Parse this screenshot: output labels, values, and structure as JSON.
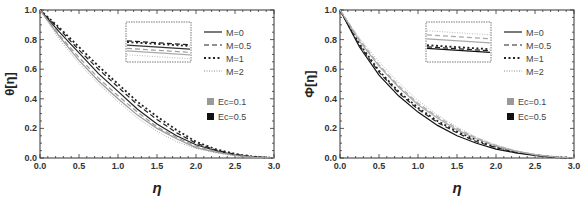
{
  "chart_data": [
    {
      "type": "line",
      "title": "",
      "xlabel": "η",
      "ylabel": "θ[η]",
      "xlim": [
        0,
        3
      ],
      "ylim": [
        0,
        1
      ],
      "xticks": [
        "0.0",
        "0.5",
        "1.0",
        "1.5",
        "2.0",
        "2.5",
        "3.0"
      ],
      "yticks": [
        "0.0",
        "0.2",
        "0.4",
        "0.6",
        "0.8",
        "1.0"
      ],
      "grid": false,
      "legend": {
        "position": "upper right",
        "line_entries": [
          "M=0",
          "M=0.5",
          "M=1",
          "M=2"
        ],
        "color_entries": [
          "Ec=0.1",
          "Ec=0.5"
        ]
      },
      "inset": true,
      "x": [
        0,
        0.25,
        0.5,
        0.75,
        1.0,
        1.25,
        1.5,
        1.75,
        2.0,
        2.25,
        2.5,
        2.75,
        3.0
      ],
      "series": [
        {
          "name": "M=0, Ec=0.5",
          "style": "solid",
          "color": "#222222",
          "values": [
            1.0,
            0.85,
            0.71,
            0.57,
            0.45,
            0.33,
            0.23,
            0.15,
            0.09,
            0.05,
            0.02,
            0.006,
            0.0
          ]
        },
        {
          "name": "M=0.5, Ec=0.5",
          "style": "dashed",
          "color": "#222222",
          "values": [
            1.0,
            0.87,
            0.73,
            0.6,
            0.48,
            0.36,
            0.26,
            0.17,
            0.1,
            0.055,
            0.025,
            0.008,
            0.0
          ]
        },
        {
          "name": "M=1, Ec=0.5",
          "style": "dotted",
          "color": "#222222",
          "values": [
            1.0,
            0.88,
            0.75,
            0.62,
            0.5,
            0.38,
            0.28,
            0.19,
            0.11,
            0.06,
            0.028,
            0.009,
            0.0
          ]
        },
        {
          "name": "M=0, Ec=0.1",
          "style": "solid",
          "color": "#999999",
          "values": [
            1.0,
            0.82,
            0.66,
            0.52,
            0.4,
            0.29,
            0.2,
            0.13,
            0.07,
            0.04,
            0.017,
            0.005,
            0.0
          ]
        },
        {
          "name": "M=0.5, Ec=0.1",
          "style": "dashed",
          "color": "#999999",
          "values": [
            1.0,
            0.83,
            0.68,
            0.54,
            0.42,
            0.31,
            0.21,
            0.14,
            0.08,
            0.045,
            0.019,
            0.006,
            0.0
          ]
        },
        {
          "name": "M=2, Ec=0.1",
          "style": "fine-dotted",
          "color": "#aaaaaa",
          "values": [
            1.0,
            0.8,
            0.64,
            0.5,
            0.38,
            0.27,
            0.18,
            0.11,
            0.065,
            0.035,
            0.015,
            0.004,
            0.0
          ]
        }
      ]
    },
    {
      "type": "line",
      "title": "",
      "xlabel": "η",
      "ylabel": "Φ[η]",
      "xlim": [
        0,
        3
      ],
      "ylim": [
        0,
        1
      ],
      "xticks": [
        "0.0",
        "0.5",
        "1.0",
        "1.5",
        "2.0",
        "2.5",
        "3.0"
      ],
      "yticks": [
        "0.0",
        "0.2",
        "0.4",
        "0.6",
        "0.8",
        "1.0"
      ],
      "grid": false,
      "legend": {
        "position": "upper right",
        "line_entries": [
          "M=0",
          "M=0.5",
          "M=1",
          "M=2"
        ],
        "color_entries": [
          "Ec=0.1",
          "Ec=0.5"
        ]
      },
      "inset": true,
      "x": [
        0,
        0.25,
        0.5,
        0.75,
        1.0,
        1.25,
        1.5,
        1.75,
        2.0,
        2.25,
        2.5,
        2.75,
        3.0
      ],
      "series": [
        {
          "name": "M=0, Ec=0.5",
          "style": "solid",
          "color": "#111111",
          "values": [
            1.0,
            0.75,
            0.56,
            0.42,
            0.31,
            0.22,
            0.15,
            0.1,
            0.06,
            0.035,
            0.017,
            0.005,
            0.0
          ]
        },
        {
          "name": "M=0.5, Ec=0.5",
          "style": "dashed",
          "color": "#222222",
          "values": [
            1.0,
            0.76,
            0.58,
            0.44,
            0.33,
            0.24,
            0.17,
            0.11,
            0.07,
            0.04,
            0.019,
            0.006,
            0.0
          ]
        },
        {
          "name": "M=1, Ec=0.5",
          "style": "dotted",
          "color": "#222222",
          "values": [
            1.0,
            0.77,
            0.59,
            0.45,
            0.34,
            0.25,
            0.18,
            0.12,
            0.075,
            0.043,
            0.02,
            0.006,
            0.0
          ]
        },
        {
          "name": "M=0, Ec=0.1",
          "style": "solid",
          "color": "#aaaaaa",
          "values": [
            1.0,
            0.79,
            0.62,
            0.48,
            0.36,
            0.27,
            0.19,
            0.13,
            0.08,
            0.046,
            0.022,
            0.007,
            0.0
          ]
        },
        {
          "name": "M=0.5, Ec=0.1",
          "style": "dashed",
          "color": "#aaaaaa",
          "values": [
            1.0,
            0.8,
            0.63,
            0.49,
            0.37,
            0.28,
            0.2,
            0.135,
            0.085,
            0.048,
            0.023,
            0.007,
            0.0
          ]
        },
        {
          "name": "M=2, Ec=0.1",
          "style": "fine-dotted",
          "color": "#bbbbbb",
          "values": [
            1.0,
            0.81,
            0.65,
            0.51,
            0.39,
            0.29,
            0.21,
            0.14,
            0.09,
            0.05,
            0.024,
            0.008,
            0.0
          ]
        }
      ]
    }
  ],
  "panels": [
    {
      "ylabel": "θ[η]",
      "xlabel": "η",
      "legend": {
        "m": [
          "M=0",
          "M=0.5",
          "M=1",
          "M=2"
        ],
        "ec": [
          "Ec=0.1",
          "Ec=0.5"
        ]
      }
    },
    {
      "ylabel": "Φ[η]",
      "xlabel": "η",
      "legend": {
        "m": [
          "M=0",
          "M=0.5",
          "M=1",
          "M=2"
        ],
        "ec": [
          "Ec=0.1",
          "Ec=0.5"
        ]
      }
    }
  ]
}
